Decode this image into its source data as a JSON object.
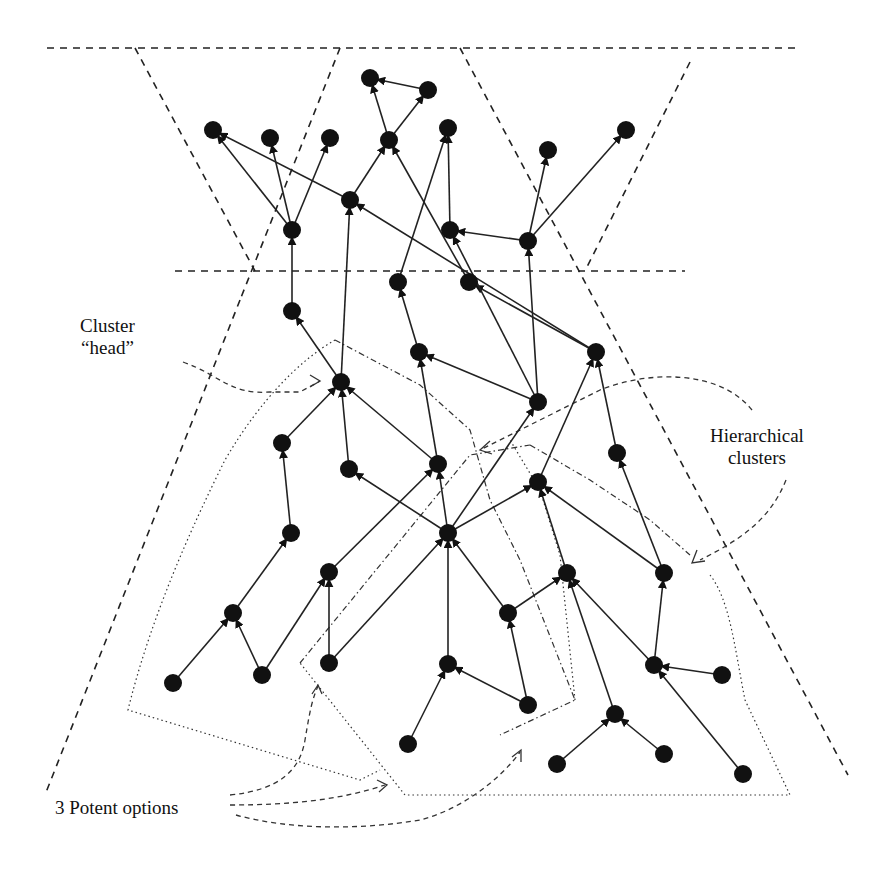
{
  "diagram": {
    "type": "hierarchical-cluster-network",
    "labels": {
      "cluster_head_line1": "Cluster",
      "cluster_head_line2": "“head”",
      "hierarchical_line1": "Hierarchical",
      "hierarchical_line2": "clusters",
      "potent_options": "3 Potent options"
    },
    "colors": {
      "node": "#111111",
      "edge": "#222222",
      "background": "#ffffff"
    },
    "nodes": [
      {
        "id": "A",
        "x": 370,
        "y": 78
      },
      {
        "id": "B",
        "x": 428,
        "y": 90
      },
      {
        "id": "C",
        "x": 213,
        "y": 130
      },
      {
        "id": "D",
        "x": 270,
        "y": 138
      },
      {
        "id": "E",
        "x": 330,
        "y": 138
      },
      {
        "id": "F",
        "x": 389,
        "y": 140
      },
      {
        "id": "G",
        "x": 448,
        "y": 128
      },
      {
        "id": "H",
        "x": 548,
        "y": 150
      },
      {
        "id": "I",
        "x": 626,
        "y": 130
      },
      {
        "id": "J",
        "x": 350,
        "y": 200
      },
      {
        "id": "K",
        "x": 292,
        "y": 230
      },
      {
        "id": "L",
        "x": 450,
        "y": 230
      },
      {
        "id": "M",
        "x": 528,
        "y": 241
      },
      {
        "id": "N",
        "x": 398,
        "y": 282
      },
      {
        "id": "O",
        "x": 469,
        "y": 282
      },
      {
        "id": "P",
        "x": 292,
        "y": 311
      },
      {
        "id": "Q",
        "x": 419,
        "y": 352
      },
      {
        "id": "R",
        "x": 596,
        "y": 352
      },
      {
        "id": "S",
        "x": 341,
        "y": 382
      },
      {
        "id": "T",
        "x": 538,
        "y": 402
      },
      {
        "id": "U",
        "x": 282,
        "y": 443
      },
      {
        "id": "V",
        "x": 349,
        "y": 469
      },
      {
        "id": "W",
        "x": 438,
        "y": 464
      },
      {
        "id": "X",
        "x": 617,
        "y": 453
      },
      {
        "id": "Y",
        "x": 291,
        "y": 533
      },
      {
        "id": "Z",
        "x": 538,
        "y": 482
      },
      {
        "id": "AA",
        "x": 448,
        "y": 533
      },
      {
        "id": "AB",
        "x": 329,
        "y": 572
      },
      {
        "id": "AC",
        "x": 567,
        "y": 573
      },
      {
        "id": "AD",
        "x": 664,
        "y": 573
      },
      {
        "id": "AE",
        "x": 233,
        "y": 613
      },
      {
        "id": "AF",
        "x": 508,
        "y": 613
      },
      {
        "id": "AG",
        "x": 173,
        "y": 683
      },
      {
        "id": "AH",
        "x": 262,
        "y": 675
      },
      {
        "id": "AI",
        "x": 329,
        "y": 663
      },
      {
        "id": "AJ",
        "x": 448,
        "y": 664
      },
      {
        "id": "AK",
        "x": 654,
        "y": 665
      },
      {
        "id": "AL",
        "x": 722,
        "y": 675
      },
      {
        "id": "AM",
        "x": 528,
        "y": 705
      },
      {
        "id": "AN",
        "x": 615,
        "y": 714
      },
      {
        "id": "AO",
        "x": 408,
        "y": 744
      },
      {
        "id": "AP",
        "x": 557,
        "y": 764
      },
      {
        "id": "AQ",
        "x": 664,
        "y": 754
      },
      {
        "id": "AR",
        "x": 743,
        "y": 774
      }
    ],
    "edges": [
      {
        "from": "B",
        "to": "A"
      },
      {
        "from": "F",
        "to": "A"
      },
      {
        "from": "F",
        "to": "B"
      },
      {
        "from": "J",
        "to": "F"
      },
      {
        "from": "J",
        "to": "C"
      },
      {
        "from": "K",
        "to": "C"
      },
      {
        "from": "K",
        "to": "D"
      },
      {
        "from": "K",
        "to": "E"
      },
      {
        "from": "L",
        "to": "G"
      },
      {
        "from": "M",
        "to": "L"
      },
      {
        "from": "M",
        "to": "H"
      },
      {
        "from": "M",
        "to": "I"
      },
      {
        "from": "O",
        "to": "F"
      },
      {
        "from": "N",
        "to": "G"
      },
      {
        "from": "P",
        "to": "K"
      },
      {
        "from": "S",
        "to": "J"
      },
      {
        "from": "R",
        "to": "J"
      },
      {
        "from": "R",
        "to": "O"
      },
      {
        "from": "T",
        "to": "M"
      },
      {
        "from": "T",
        "to": "L"
      },
      {
        "from": "Q",
        "to": "N"
      },
      {
        "from": "T",
        "to": "Q"
      },
      {
        "from": "S",
        "to": "P"
      },
      {
        "from": "U",
        "to": "S"
      },
      {
        "from": "V",
        "to": "S"
      },
      {
        "from": "W",
        "to": "S"
      },
      {
        "from": "W",
        "to": "Q"
      },
      {
        "from": "X",
        "to": "R"
      },
      {
        "from": "Y",
        "to": "U"
      },
      {
        "from": "Z",
        "to": "R"
      },
      {
        "from": "AA",
        "to": "W"
      },
      {
        "from": "AA",
        "to": "V"
      },
      {
        "from": "AA",
        "to": "T"
      },
      {
        "from": "AA",
        "to": "Z"
      },
      {
        "from": "AB",
        "to": "W"
      },
      {
        "from": "AC",
        "to": "Z"
      },
      {
        "from": "AD",
        "to": "Z"
      },
      {
        "from": "AD",
        "to": "X"
      },
      {
        "from": "AE",
        "to": "Y"
      },
      {
        "from": "AF",
        "to": "AA"
      },
      {
        "from": "AF",
        "to": "AC"
      },
      {
        "from": "AG",
        "to": "AE"
      },
      {
        "from": "AH",
        "to": "AE"
      },
      {
        "from": "AH",
        "to": "AB"
      },
      {
        "from": "AI",
        "to": "AB"
      },
      {
        "from": "AI",
        "to": "AA"
      },
      {
        "from": "AJ",
        "to": "AA"
      },
      {
        "from": "AM",
        "to": "AF"
      },
      {
        "from": "AM",
        "to": "AJ"
      },
      {
        "from": "AO",
        "to": "AJ"
      },
      {
        "from": "AN",
        "to": "AC"
      },
      {
        "from": "AK",
        "to": "AD"
      },
      {
        "from": "AK",
        "to": "AC"
      },
      {
        "from": "AL",
        "to": "AK"
      },
      {
        "from": "AR",
        "to": "AK"
      },
      {
        "from": "AP",
        "to": "AN"
      },
      {
        "from": "AQ",
        "to": "AN"
      }
    ]
  }
}
